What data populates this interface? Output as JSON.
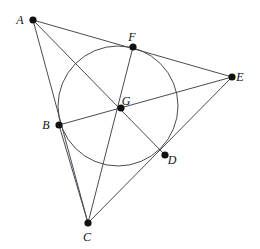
{
  "figure": {
    "type": "geometry-diagram",
    "width": 260,
    "height": 249,
    "background": "#ffffff",
    "line_color": "#4a4a52",
    "point_color": "#111111",
    "label_color": "#111111"
  },
  "points": [
    {
      "id": "A",
      "label": "A",
      "x": 33,
      "y": 20,
      "label_dx": -13,
      "label_dy": 1,
      "dot_r": 3.6
    },
    {
      "id": "F",
      "label": "F",
      "x": 133,
      "y": 47,
      "label_dx": -1,
      "label_dy": -9,
      "dot_r": 3.6
    },
    {
      "id": "E",
      "label": "E",
      "x": 232,
      "y": 77,
      "label_dx": 8,
      "label_dy": 1,
      "dot_r": 3.6
    },
    {
      "id": "G",
      "label": "G",
      "x": 121,
      "y": 108,
      "label_dx": 5,
      "label_dy": -6,
      "dot_r": 3.6
    },
    {
      "id": "B",
      "label": "B",
      "x": 59,
      "y": 125,
      "label_dx": -13,
      "label_dy": 1,
      "dot_r": 3.6
    },
    {
      "id": "D",
      "label": "D",
      "x": 165,
      "y": 155,
      "label_dx": 7,
      "label_dy": 6,
      "dot_r": 3.6
    },
    {
      "id": "C",
      "label": "C",
      "x": 88,
      "y": 223,
      "label_dx": -1,
      "label_dy": 15,
      "dot_r": 3.6
    }
  ],
  "segments": [
    {
      "name": "segment-A-E",
      "from": "A",
      "to": "E"
    },
    {
      "name": "segment-A-C",
      "from": "A",
      "to": "C"
    },
    {
      "name": "segment-A-D",
      "from": "A",
      "to": "D"
    },
    {
      "name": "segment-B-E",
      "from": "B",
      "to": "E"
    },
    {
      "name": "segment-E-C",
      "from": "E",
      "to": "C"
    },
    {
      "name": "segment-B-C",
      "from": "B",
      "to": "C"
    },
    {
      "name": "segment-F-C",
      "from": "F",
      "to": "C"
    }
  ],
  "circle": {
    "name": "circumscribed-circle",
    "cx": 118,
    "cy": 106,
    "r": 60
  },
  "labels_note": "Labels A, F, E, G, B, D, C rendered in italic serif"
}
